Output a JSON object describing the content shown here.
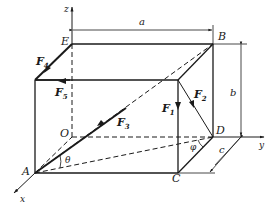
{
  "diagram": {
    "type": "3d-box-force-diagram",
    "axes": {
      "x": "x",
      "y": "y",
      "z": "z"
    },
    "points": {
      "E": "E",
      "B": "B",
      "O": "O",
      "A": "A",
      "C": "C",
      "D": "D"
    },
    "dimensions": {
      "a": "a",
      "b": "b",
      "c": "c"
    },
    "angles": {
      "theta": "θ",
      "phi": "φ"
    },
    "forces": {
      "F1": {
        "base": "F",
        "sub": "1"
      },
      "F2": {
        "base": "F",
        "sub": "2"
      },
      "F3": {
        "base": "F",
        "sub": "3"
      },
      "F4": {
        "base": "F",
        "sub": "4"
      },
      "F5": {
        "base": "F",
        "sub": "5"
      }
    },
    "colors": {
      "line": "#1a1a1a",
      "background": "#ffffff"
    }
  }
}
